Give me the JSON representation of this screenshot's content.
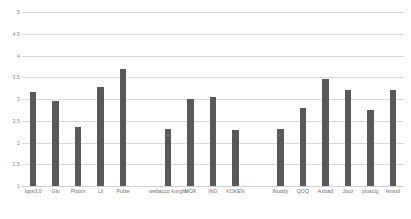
{
  "chart_data": {
    "type": "bar",
    "title": "",
    "subtitle": "",
    "xlabel": "",
    "ylabel": "",
    "ylim": [
      1,
      5
    ],
    "ytick_values": [
      5,
      4.5,
      4,
      3.5,
      3,
      2.5,
      2,
      1.5,
      1
    ],
    "ytick_labels": [
      "5",
      "4.5",
      "4",
      "3.5",
      "3",
      "2.5",
      "2",
      "1.5",
      "1"
    ],
    "grid": true,
    "gridlines": "horizontal",
    "legend": null,
    "legend_position": "none",
    "bar_color": "#595959",
    "background_color": "#ffffff",
    "grid_color": "#d9d9d9",
    "tick_label_color": "#7f7f7f",
    "categories": [
      "iqos3.0",
      "Glo",
      "Ploom",
      "Lil",
      "Pulze",
      "",
      "webacco kungfu",
      "MOK",
      "ING",
      "KOKEN",
      "",
      "Ibuddy",
      "QOQ",
      "Axbad",
      "Jouz",
      "pluscig",
      "Ismod"
    ],
    "values": [
      3.15,
      2.95,
      2.35,
      3.28,
      3.7,
      null,
      2.3,
      3.0,
      3.05,
      2.28,
      null,
      2.32,
      2.8,
      3.45,
      3.2,
      2.75,
      3.2
    ]
  }
}
